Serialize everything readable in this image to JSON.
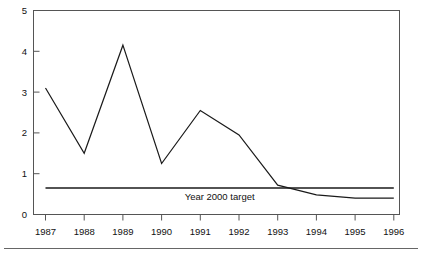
{
  "chart_data": {
    "type": "line",
    "title": "",
    "subtitle": "",
    "xlabel": "",
    "ylabel": "",
    "categories": [
      "1987",
      "1988",
      "1989",
      "1990",
      "1991",
      "1992",
      "1993",
      "1994",
      "1995",
      "1996"
    ],
    "xlim": [
      1987,
      1996
    ],
    "ylim": [
      0,
      5
    ],
    "ytick_labels": [
      "0",
      "1",
      "2",
      "3",
      "4",
      "5"
    ],
    "ytick_values": [
      0,
      1,
      2,
      3,
      4,
      5
    ],
    "grid": false,
    "legend": "none",
    "series": [
      {
        "name": "emissions",
        "values": [
          3.1,
          1.5,
          4.15,
          1.25,
          2.55,
          1.95,
          0.72,
          0.48,
          0.4,
          0.4
        ],
        "color": "#1a1a1a"
      },
      {
        "name": "Year 2000 target",
        "values": [
          0.65,
          0.65,
          0.65,
          0.65,
          0.65,
          0.65,
          0.65,
          0.65,
          0.65,
          0.65
        ],
        "color": "#1a1a1a"
      }
    ],
    "annotations": [
      {
        "text": "Year 2000 target",
        "x": 1991.5,
        "y": 0.42
      }
    ]
  },
  "axis": {
    "y_tick_0": "0",
    "y_tick_1": "1",
    "y_tick_2": "2",
    "y_tick_3": "3",
    "y_tick_4": "4",
    "y_tick_5": "5",
    "x_tick_0": "1987",
    "x_tick_1": "1988",
    "x_tick_2": "1989",
    "x_tick_3": "1990",
    "x_tick_4": "1991",
    "x_tick_5": "1992",
    "x_tick_6": "1993",
    "x_tick_7": "1994",
    "x_tick_8": "1995",
    "x_tick_9": "1996"
  },
  "annotation": {
    "target_label": "Year 2000 target"
  },
  "colors": {
    "line": "#1a1a1a",
    "frame": "#555555",
    "text": "#111111",
    "rule": "#666666",
    "background": "#ffffff"
  }
}
